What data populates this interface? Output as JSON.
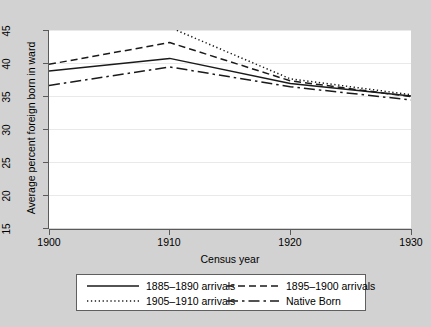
{
  "chart_data": {
    "type": "line",
    "title": "",
    "xlabel": "Census year",
    "ylabel": "Average percent foreign born in ward",
    "x": [
      1900,
      1910,
      1920,
      1930
    ],
    "xlim": [
      1900,
      1930
    ],
    "ylim": [
      15,
      45
    ],
    "xticks": [
      "1900",
      "1910",
      "1920",
      "1930"
    ],
    "yticks": [
      "15",
      "20",
      "25",
      "30",
      "35",
      "40",
      "45"
    ],
    "grid": "horizontal",
    "legend_position": "bottom",
    "series": [
      {
        "name": "1885–1890 arrivals",
        "style": "solid",
        "x": [
          1900,
          1910,
          1920,
          1930
        ],
        "values": [
          38.8,
          40.7,
          36.9,
          35.0
        ]
      },
      {
        "name": "1895–1900 arrivals",
        "style": "dashed",
        "x": [
          1900,
          1910,
          1920,
          1930
        ],
        "values": [
          39.8,
          43.1,
          37.3,
          34.9
        ]
      },
      {
        "name": "1905–1910 arrivals",
        "style": "dotted",
        "x": [
          1910,
          1920,
          1930
        ],
        "values": [
          45.4,
          37.6,
          35.2
        ]
      },
      {
        "name": "Native Born",
        "style": "dashdot",
        "x": [
          1900,
          1910,
          1920,
          1930
        ],
        "values": [
          36.6,
          39.4,
          36.4,
          34.4
        ]
      }
    ]
  },
  "colors": {
    "line": "#1a1a1a",
    "axis": "#5a5a5a",
    "grid": "#e9e9e9",
    "plot_background": "#ffffff",
    "figure_background": "#d2d2d2",
    "legend_border": "#5f5f5f",
    "text": "#000000"
  },
  "axes": {
    "xlabel": "Census year",
    "ylabel": "Average percent foreign born in ward",
    "xticks": [
      "1900",
      "1910",
      "1920",
      "1930"
    ],
    "yticks": [
      "45",
      "40",
      "35",
      "30",
      "25",
      "20",
      "15"
    ]
  },
  "legend": {
    "entries": [
      {
        "label": "1885–1890 arrivals",
        "style": "solid"
      },
      {
        "label": "1895–1900 arrivals",
        "style": "dashed"
      },
      {
        "label": "1905–1910 arrivals",
        "style": "dotted"
      },
      {
        "label": "Native Born",
        "style": "dashdot"
      }
    ]
  }
}
